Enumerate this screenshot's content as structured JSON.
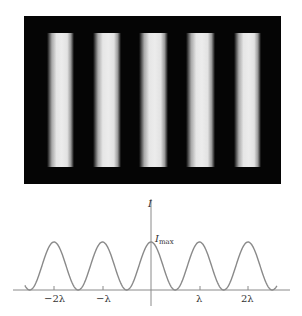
{
  "figure": {
    "photo": {
      "description": "Interference fringe pattern",
      "background_color": "#050505",
      "fringe_color": "#e8e8e8",
      "fringe_count": 5,
      "fringes": [
        {
          "left": 23,
          "width": 27
        },
        {
          "left": 69,
          "width": 28
        },
        {
          "left": 115,
          "width": 29
        },
        {
          "left": 162,
          "width": 29
        },
        {
          "left": 210,
          "width": 27
        }
      ]
    },
    "graph": {
      "y_axis_label": "I",
      "peak_label_main": "I",
      "peak_label_sub": "max",
      "x_tick_labels": [
        "−2λ",
        "−λ",
        "λ",
        "2λ"
      ],
      "curve_color": "#8a8a8a",
      "axis_color": "#8a8a8a"
    }
  },
  "chart_data": {
    "type": "line",
    "title": "",
    "xlabel": "",
    "ylabel": "I",
    "x_ticks": [
      "-2λ",
      "-λ",
      "0",
      "λ",
      "2λ"
    ],
    "x_tick_labels_shown": [
      "-2λ",
      "-λ",
      "λ",
      "2λ"
    ],
    "function": "I = I_max * cos^2(pi * x / lambda)",
    "peaks_at": [
      -2,
      -1,
      0,
      1,
      2
    ],
    "peak_value": "I_max",
    "x_range_in_lambda": [
      -2.6,
      2.6
    ],
    "annotations": [
      "I_max"
    ],
    "grid": false
  }
}
